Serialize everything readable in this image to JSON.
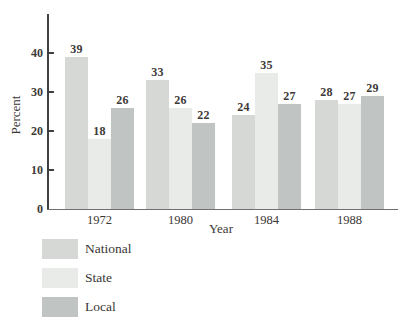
{
  "chart_data": {
    "type": "bar",
    "title": "",
    "categories": [
      "1972",
      "1980",
      "1984",
      "1988"
    ],
    "series": [
      {
        "name": "National",
        "color": "#d6d8d6",
        "values": [
          39,
          33,
          24,
          28
        ]
      },
      {
        "name": "State",
        "color": "#e9ebe8",
        "values": [
          18,
          26,
          35,
          27
        ]
      },
      {
        "name": "Local",
        "color": "#c0c4c2",
        "values": [
          26,
          22,
          27,
          29
        ]
      }
    ],
    "xlabel": "Year",
    "ylabel": "Percent",
    "yticks": [
      0,
      10,
      20,
      30,
      40
    ],
    "ylim": [
      0,
      50
    ],
    "grid": false,
    "value_labels": true,
    "legend_position": "bottom-left",
    "axis_color": "#3f3f3f",
    "label_color": "#3d3936"
  }
}
